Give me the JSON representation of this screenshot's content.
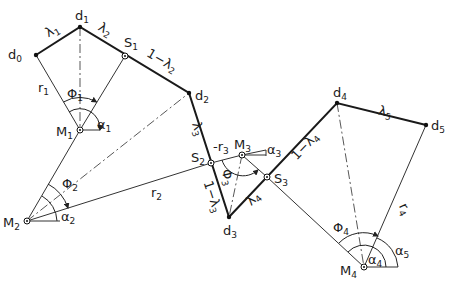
{
  "figure": {
    "type": "geometric-construction",
    "points": {
      "d0": {
        "label": "d",
        "sub": "0",
        "x": 36,
        "y": 55
      },
      "d1": {
        "label": "d",
        "sub": "1",
        "x": 80,
        "y": 27
      },
      "d2": {
        "label": "d",
        "sub": "2",
        "x": 189,
        "y": 93
      },
      "d3": {
        "label": "d",
        "sub": "3",
        "x": 229,
        "y": 217
      },
      "d4": {
        "label": "d",
        "sub": "4",
        "x": 337,
        "y": 103
      },
      "d5": {
        "label": "d",
        "sub": "5",
        "x": 426,
        "y": 125
      },
      "S1": {
        "label": "S",
        "sub": "1",
        "x": 125,
        "y": 56
      },
      "S2": {
        "label": "S",
        "sub": "2",
        "x": 211,
        "y": 163
      },
      "S3": {
        "label": "S",
        "sub": "3",
        "x": 267,
        "y": 177
      },
      "M1": {
        "label": "M",
        "sub": "1",
        "x": 80,
        "y": 130
      },
      "M2": {
        "label": "M",
        "sub": "2",
        "x": 27,
        "y": 221
      },
      "M3": {
        "label": "M",
        "sub": "3",
        "x": 242,
        "y": 155
      },
      "M4": {
        "label": "M",
        "sub": "4",
        "x": 364,
        "y": 267
      }
    },
    "segment_labels": {
      "lambda1": {
        "text": "λ",
        "sub": "1"
      },
      "lambda2": {
        "text": "λ",
        "sub": "2"
      },
      "one_minus_lambda2": {
        "text": "1−λ",
        "sub": "2"
      },
      "lambda3": {
        "text": "λ",
        "sub": "3"
      },
      "one_minus_lambda3": {
        "text": "1−λ",
        "sub": "3"
      },
      "lambda4": {
        "text": "λ",
        "sub": "4"
      },
      "one_minus_lambda4": {
        "text": "1−λ",
        "sub": "4"
      },
      "lambda5": {
        "text": "λ",
        "sub": "5"
      }
    },
    "radius_labels": {
      "r1": {
        "text": "r",
        "sub": "1"
      },
      "r2": {
        "text": "r",
        "sub": "2"
      },
      "r3": {
        "text": "-r",
        "sub": "3"
      },
      "r4": {
        "text": "r",
        "sub": "4"
      }
    },
    "angle_labels": {
      "phi1": {
        "text": "Φ",
        "sub": "1"
      },
      "phi2": {
        "text": "Φ",
        "sub": "2"
      },
      "phi3": {
        "text": "Φ",
        "sub": "3"
      },
      "phi4": {
        "text": "Φ",
        "sub": "4"
      },
      "alpha1": {
        "text": "α",
        "sub": "1"
      },
      "alpha2": {
        "text": "α",
        "sub": "2"
      },
      "alpha3": {
        "text": "α",
        "sub": "3"
      },
      "alpha4": {
        "text": "α",
        "sub": "4"
      },
      "alpha5": {
        "text": "α",
        "sub": "5"
      }
    }
  }
}
